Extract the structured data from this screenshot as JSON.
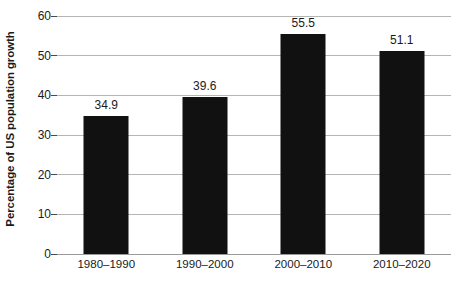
{
  "chart_data": {
    "type": "bar",
    "title": "",
    "xlabel": "",
    "ylabel": "Percentage of US population growth",
    "categories": [
      "1980–1990",
      "1990–2000",
      "2000–2010",
      "2010–2020"
    ],
    "values": [
      34.9,
      39.6,
      55.5,
      51.1
    ],
    "value_labels": [
      "34.9",
      "39.6",
      "55.5",
      "51.1"
    ],
    "ylim": [
      0,
      60
    ],
    "ytick_values": [
      0,
      10,
      20,
      30,
      40,
      50,
      60
    ],
    "ytick_labels": [
      "0",
      "10",
      "20",
      "30",
      "40",
      "50",
      "60"
    ],
    "grid": true,
    "grid_axis": "y",
    "legend": false,
    "legend_position": "none",
    "bar_color": "#111111",
    "grid_color": "#b5b5b5",
    "axis_color": "#9a9a9a",
    "text_color": "#1a1a1a",
    "background_color": "#ffffff"
  }
}
